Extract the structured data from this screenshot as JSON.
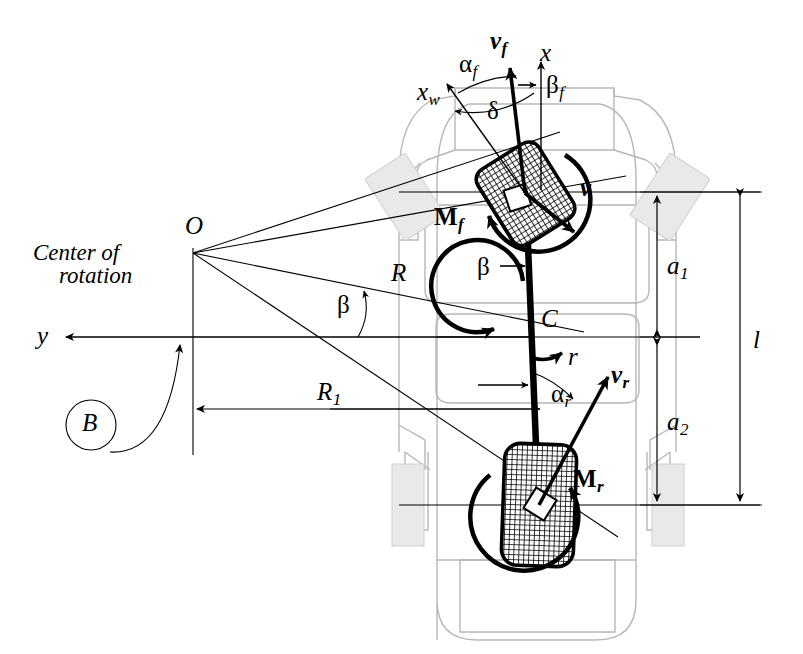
{
  "figure": {
    "type": "engineering-diagram",
    "background_color": "#ffffff",
    "line_color": "#000000",
    "body_outline_color": "#b9b9b9",
    "body_fill_color": "#eeeeee"
  },
  "labels": {
    "center_of_rotation_line1": "Center of",
    "center_of_rotation_line2": "rotation",
    "point_O": "O",
    "point_C": "C",
    "point_B": "B",
    "axis_y": "y",
    "axis_x": "x",
    "axis_xw_base": "x",
    "axis_xw_sub": "w",
    "radius_R": "R",
    "radius_R1_base": "R",
    "radius_R1_sub": "1",
    "wheelbase_l": "l",
    "dist_a1_base": "a",
    "dist_a1_sub": "1",
    "dist_a2_base": "a",
    "dist_a2_sub": "2",
    "yaw_rate_r": "r",
    "velocity_v": "v",
    "velocity_vf_base": "v",
    "velocity_vf_sub": "f",
    "velocity_vr_base": "v",
    "velocity_vr_sub": "r",
    "moment_Mf_base": "M",
    "moment_Mf_sub": "f",
    "moment_Mr_base": "M",
    "moment_Mr_sub": "r",
    "slip_alpha_f_base": "α",
    "slip_alpha_f_sub": "f",
    "slip_alpha_r_base": "α",
    "slip_alpha_r_sub": "r",
    "sideslip_beta": "β",
    "sideslip_beta_center": "β",
    "sideslip_beta_f_base": "β",
    "sideslip_beta_f_sub": "f",
    "steer_angle_delta": "δ"
  },
  "geometry": {
    "center_of_rotation_O": [
      193,
      253
    ],
    "center_of_mass_C": [
      517,
      325
    ],
    "front_wheel_center": [
      525,
      193
    ],
    "rear_wheel_center": [
      539,
      505
    ],
    "y_axis_line_y": 337,
    "R1_dimension_line_y": 409,
    "a1_a2_dimension_x": 657,
    "l_dimension_x": 740,
    "front_axle_y": 192,
    "rear_axle_y": 505
  }
}
